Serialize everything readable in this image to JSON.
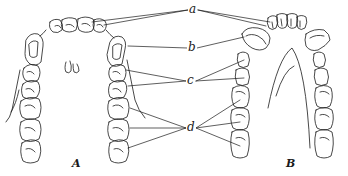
{
  "figure": {
    "labels": {
      "a": "a",
      "b": "b",
      "c": "c",
      "d": "d"
    },
    "captions": {
      "left": "A",
      "right": "B"
    },
    "colors": {
      "ink": "#1a1a1a",
      "background": "#ffffff"
    }
  }
}
